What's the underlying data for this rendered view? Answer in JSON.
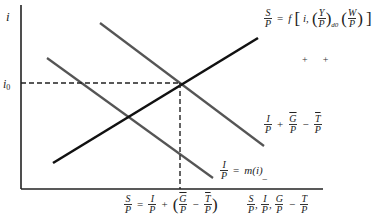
{
  "diagram": {
    "type": "economics-equilibrium-diagram",
    "axes": {
      "y_label": "i",
      "x_label": {
        "parts": [
          "S/P",
          "I/P",
          "Ḡ/P − T̄/P"
        ],
        "separator": ","
      }
    },
    "equilibrium": {
      "y_marker": "i",
      "y_marker_sub": "0",
      "x_marker": "S/P = I/P + (Ḡ/P − T̄/P)"
    },
    "curves": [
      {
        "id": "saving",
        "color": "#111111",
        "label": "S/P = f[i, (Y/P)_d0 (W/P)]",
        "signs": [
          "+",
          "+"
        ]
      },
      {
        "id": "investment-plus-deficit",
        "color": "#555555",
        "label": "I/P + Ḡ/P − T̄/P"
      },
      {
        "id": "investment",
        "color": "#555555",
        "label": "I/P = m(i)",
        "sign": "−"
      }
    ]
  },
  "text": {
    "i": "i",
    "i0": "i",
    "zero": "0",
    "S": "S",
    "P": "P",
    "I": "I",
    "G": "G",
    "T": "T",
    "Y": "Y",
    "W": "W",
    "eq": "=",
    "plus": "+",
    "minus": "−",
    "comma": ",",
    "f": "f",
    "m_of_i": "m(i)",
    "d0": "d0",
    "lparen": "(",
    "rparen": ")",
    "lbrack": "[",
    "rbrack": "]",
    "i_comma": "i,",
    "signs": "+      +",
    "neg_sign": "−"
  }
}
